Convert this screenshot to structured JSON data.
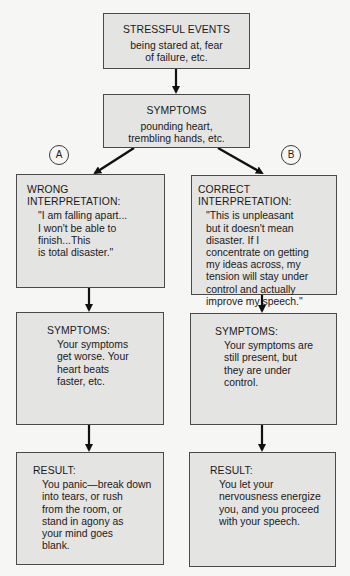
{
  "diagram": {
    "stressful_events": {
      "title": "STRESSFUL EVENTS",
      "body": "being stared at, fear\nof failure, etc."
    },
    "initial_symptoms": {
      "title": "SYMPTOMS",
      "body": "pounding heart,\ntrembling hands, etc."
    },
    "branch_a": {
      "marker": "A",
      "interpretation": {
        "title": "WRONG INTERPRETATION:",
        "body": "\"I am falling apart...\nI won't be able to\nfinish...This\nis total disaster.\""
      },
      "symptoms": {
        "title": "SYMPTOMS:",
        "body": "Your symptoms\nget worse. Your\nheart beats\nfaster, etc."
      },
      "result": {
        "title": "RESULT:",
        "body": "You panic—break down\ninto tears, or rush\nfrom the room, or\nstand in agony as\nyour mind goes\nblank."
      }
    },
    "branch_b": {
      "marker": "B",
      "interpretation": {
        "title": "CORRECT INTERPRETATION:",
        "body": "\"This is unpleasant\nbut it doesn't mean\ndisaster. If I\nconcentrate on getting\nmy ideas across, my\ntension will stay under\ncontrol and actually\nimprove my speech.\""
      },
      "symptoms": {
        "title": "SYMPTOMS:",
        "body": "Your symptoms are\nstill present, but\nthey are under\ncontrol."
      },
      "result": {
        "title": "RESULT:",
        "body": "You let your\nnervousness energize\nyou, and you proceed\nwith your speech."
      }
    },
    "colors": {
      "background": "#f6f6f5",
      "box_fill": "#e4e4e3",
      "box_border": "#4a4a4a",
      "arrow": "#111111",
      "text": "#1a1a1a"
    }
  }
}
